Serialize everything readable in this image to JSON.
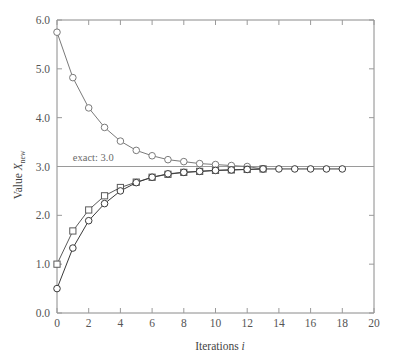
{
  "chart_data": {
    "type": "line",
    "title": "",
    "xlabel": "Iterations i",
    "ylabel": "Value X_new",
    "xlim": [
      0,
      20
    ],
    "ylim": [
      0.0,
      6.0
    ],
    "xticks": [
      0,
      2,
      4,
      6,
      8,
      10,
      12,
      14,
      16,
      18,
      20
    ],
    "xtick_labels": [
      "0",
      "2",
      "4",
      "6",
      "8",
      "10",
      "12",
      "14",
      "16",
      "18",
      "20"
    ],
    "yticks": [
      0.0,
      1.0,
      2.0,
      3.0,
      4.0,
      5.0,
      6.0
    ],
    "ytick_labels": [
      "0.0",
      "1.0",
      "2.0",
      "3.0",
      "4.0",
      "5.0",
      "6.0"
    ],
    "grid": false,
    "legend": "none",
    "annotations": [
      {
        "text": "exact: 3.0",
        "x": 1.0,
        "y": 3.12,
        "kind": "reference-line-label"
      }
    ],
    "reference_lines": [
      {
        "name": "exact-value",
        "orientation": "horizontal",
        "value": 3.0,
        "color": "#9a9a9a"
      }
    ],
    "series": [
      {
        "name": "descending-from-5.75",
        "marker": "circle",
        "color": "#7a7a7a",
        "x": [
          0,
          1,
          2,
          3,
          4,
          5,
          6,
          7,
          8,
          9,
          10,
          11,
          12,
          13
        ],
        "values": [
          5.75,
          4.82,
          4.2,
          3.8,
          3.52,
          3.33,
          3.22,
          3.14,
          3.1,
          3.06,
          3.04,
          3.02,
          3.0,
          2.95
        ]
      },
      {
        "name": "ascending-from-1.0",
        "marker": "square",
        "color": "#5a5a5a",
        "x": [
          0,
          1,
          2,
          3,
          4,
          5,
          6,
          7,
          8,
          9,
          10,
          11,
          12,
          13
        ],
        "values": [
          1.0,
          1.68,
          2.11,
          2.4,
          2.57,
          2.68,
          2.78,
          2.84,
          2.88,
          2.9,
          2.92,
          2.93,
          2.94,
          2.95
        ]
      },
      {
        "name": "ascending-from-0.5",
        "marker": "circle",
        "color": "#3a3a3a",
        "x": [
          0,
          1,
          2,
          3,
          4,
          5,
          6,
          7,
          8,
          9,
          10,
          11,
          12,
          13,
          14,
          15,
          16,
          17,
          18
        ],
        "values": [
          0.5,
          1.33,
          1.89,
          2.24,
          2.5,
          2.67,
          2.78,
          2.85,
          2.88,
          2.9,
          2.92,
          2.93,
          2.94,
          2.95,
          2.95,
          2.95,
          2.95,
          2.95,
          2.95
        ]
      }
    ]
  },
  "axes": {
    "ylabel_main": "Value",
    "ylabel_symbol": "X",
    "ylabel_subscript": "new",
    "xlabel_main": "Iterations",
    "xlabel_symbol": "i"
  },
  "colors": {
    "axis": "#8a8a8a",
    "text": "#555555",
    "reference": "#9a9a9a",
    "series_1": "#7a7a7a",
    "series_2": "#5a5a5a",
    "series_3": "#3a3a3a",
    "background": "#ffffff"
  }
}
